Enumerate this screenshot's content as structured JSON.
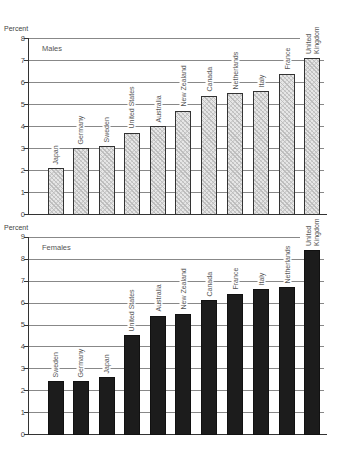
{
  "chart_data": [
    {
      "type": "bar",
      "title": "Males",
      "ylabel": "Percent",
      "xlabel": "",
      "ylim": [
        0,
        8
      ],
      "yticks": [
        0,
        1,
        2,
        3,
        4,
        5,
        6,
        7,
        8
      ],
      "grid": true,
      "categories": [
        "Japan",
        "Germany",
        "Sweden",
        "United States",
        "Australia",
        "New Zealand",
        "Canada",
        "Netherlands",
        "Italy",
        "France",
        "United Kingdom"
      ],
      "values": [
        2.1,
        3.0,
        3.1,
        3.7,
        4.0,
        4.7,
        5.4,
        5.5,
        5.6,
        6.4,
        7.1
      ],
      "fill": "hatched light gray"
    },
    {
      "type": "bar",
      "title": "Females",
      "ylabel": "Percent",
      "xlabel": "",
      "ylim": [
        0,
        9
      ],
      "yticks": [
        0,
        1,
        2,
        3,
        4,
        5,
        6,
        7,
        8,
        9
      ],
      "grid": true,
      "categories": [
        "Sweden",
        "Germany",
        "Japan",
        "United States",
        "Australia",
        "New Zealand",
        "Canada",
        "France",
        "Italy",
        "Netherlands",
        "United Kingdom"
      ],
      "values": [
        2.4,
        2.4,
        2.6,
        4.5,
        5.4,
        5.5,
        6.1,
        6.4,
        6.6,
        6.7,
        8.4
      ],
      "fill": "#1c1c1c"
    }
  ],
  "males": {
    "ylabel": "Percent",
    "title": "Males"
  },
  "females": {
    "ylabel": "Percent",
    "title": "Females"
  },
  "colors": {
    "male_fill": "#e6e6e6",
    "female_fill": "#1c1c1c",
    "grid": "#888888",
    "axis": "#333333"
  }
}
